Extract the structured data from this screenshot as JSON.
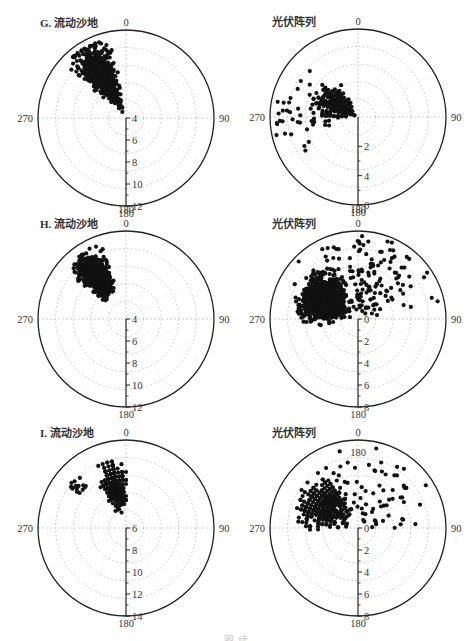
{
  "figure": {
    "caption": "图 续"
  },
  "chart_data": [
    {
      "id": "G-left",
      "type": "scatter",
      "projection": "polar",
      "title": "G. 流动沙地",
      "angle_labels": {
        "top": "0",
        "right": "90",
        "bottom": "180",
        "left": "270"
      },
      "radial_ticks": [
        "4",
        "6",
        "8",
        "10",
        "12"
      ],
      "radial_range": [
        2,
        12
      ],
      "center": [
        126,
        118
      ],
      "radius": 88,
      "extra_labels": [],
      "clusters": [
        {
          "angle_center": 330,
          "angle_spread": 22,
          "r_min": 0.02,
          "r_max": 0.92,
          "count": 650,
          "pattern": "dense",
          "peak": 0.55
        }
      ]
    },
    {
      "id": "G-right",
      "type": "scatter",
      "projection": "polar",
      "title": "光伏阵列",
      "angle_labels": {
        "top": "0",
        "right": "90",
        "bottom": "180",
        "left": "270"
      },
      "radial_ticks": [
        "2",
        "4",
        "6"
      ],
      "radial_range": [
        0,
        6
      ],
      "center": [
        358,
        117
      ],
      "radius": 88,
      "extra_labels": [],
      "clusters": [
        {
          "angle_center": 300,
          "angle_spread": 40,
          "r_min": 0.02,
          "r_max": 0.6,
          "count": 260,
          "pattern": "rings",
          "peak": 0.3
        },
        {
          "angle_center": 280,
          "angle_spread": 55,
          "r_min": 0.3,
          "r_max": 0.95,
          "count": 45,
          "pattern": "sparse",
          "peak": 0.55
        }
      ]
    },
    {
      "id": "H-left",
      "type": "scatter",
      "projection": "polar",
      "title": "H. 流动沙地",
      "angle_labels": {
        "top": "0",
        "right": "90",
        "bottom": "180",
        "left": "270"
      },
      "radial_ticks": [
        "4",
        "6",
        "8",
        "10",
        "12"
      ],
      "radial_range": [
        2,
        12
      ],
      "center": [
        126,
        319
      ],
      "radius": 88,
      "extra_labels": [
        {
          "text": "180",
          "dx": 0,
          "dy": -106
        }
      ],
      "clusters": [
        {
          "angle_center": 325,
          "angle_spread": 20,
          "r_min": 0.25,
          "r_max": 0.9,
          "count": 650,
          "pattern": "dense",
          "peak": 0.6
        }
      ]
    },
    {
      "id": "H-right",
      "type": "scatter",
      "projection": "polar",
      "title": "光伏阵列",
      "angle_labels": {
        "top": "0",
        "right": "90",
        "bottom": "180",
        "left": "270"
      },
      "radial_ticks": [
        "0",
        "2",
        "4",
        "6",
        "8"
      ],
      "radial_range": [
        0,
        8
      ],
      "center": [
        358,
        319
      ],
      "radius": 88,
      "extra_labels": [
        {
          "text": "180",
          "dx": 0,
          "dy": -106
        }
      ],
      "clusters": [
        {
          "angle_center": 300,
          "angle_spread": 45,
          "r_min": 0.05,
          "r_max": 0.75,
          "count": 900,
          "pattern": "dense",
          "peak": 0.45
        },
        {
          "angle_center": 20,
          "angle_spread": 90,
          "r_min": 0.1,
          "r_max": 0.95,
          "count": 140,
          "pattern": "sparse",
          "peak": 0.6
        }
      ]
    },
    {
      "id": "I-left",
      "type": "scatter",
      "projection": "polar",
      "title": "I. 流动沙地",
      "angle_labels": {
        "top": "0",
        "right": "90",
        "bottom": "180",
        "left": "270"
      },
      "radial_ticks": [
        "6",
        "8",
        "10",
        "12",
        "14"
      ],
      "radial_range": [
        4,
        14
      ],
      "center": [
        126,
        528
      ],
      "radius": 88,
      "extra_labels": [],
      "clusters": [
        {
          "angle_center": 345,
          "angle_spread": 20,
          "r_min": 0.2,
          "r_max": 0.85,
          "count": 320,
          "pattern": "rings",
          "peak": 0.5
        },
        {
          "angle_center": 310,
          "angle_spread": 12,
          "r_min": 0.65,
          "r_max": 0.82,
          "count": 18,
          "pattern": "sparse",
          "peak": 0.75
        }
      ]
    },
    {
      "id": "I-right",
      "type": "scatter",
      "projection": "polar",
      "title": "光伏阵列",
      "angle_labels": {
        "top": "0",
        "right": "90",
        "bottom": "180",
        "left": "270"
      },
      "radial_ticks": [
        "0",
        "2",
        "4",
        "6",
        "8"
      ],
      "radial_range": [
        0,
        8
      ],
      "center": [
        358,
        528
      ],
      "radius": 88,
      "extra_labels": [
        {
          "text": "180",
          "dx": 0,
          "dy": -72
        }
      ],
      "clusters": [
        {
          "angle_center": 305,
          "angle_spread": 45,
          "r_min": 0.08,
          "r_max": 0.8,
          "count": 460,
          "pattern": "rings",
          "peak": 0.45
        },
        {
          "angle_center": 40,
          "angle_spread": 90,
          "r_min": 0.1,
          "r_max": 0.95,
          "count": 60,
          "pattern": "sparse",
          "peak": 0.6
        }
      ]
    }
  ]
}
